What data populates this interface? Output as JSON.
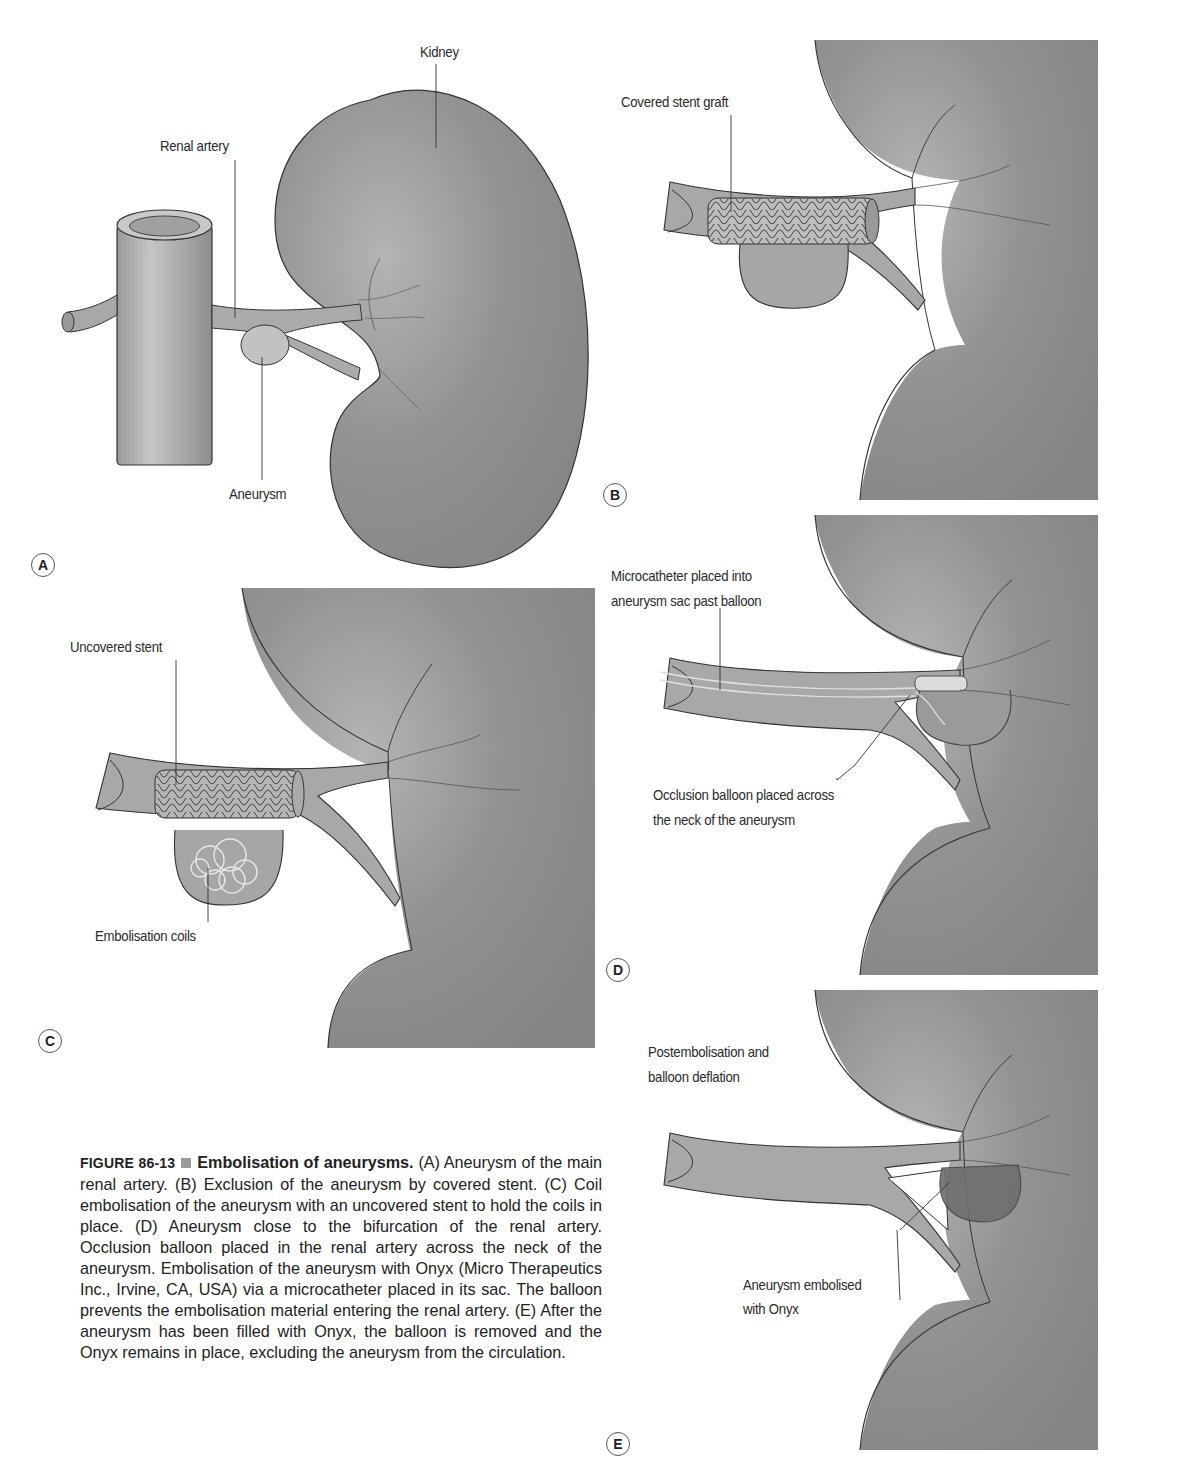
{
  "figure": {
    "number": "FIGURE 86-13",
    "title": "Embolisation of aneurysms.",
    "caption_body": "(A) Aneurysm of the main renal artery. (B) Exclusion of the aneurysm by covered stent. (C) Coil embolisation of the aneurysm with an uncovered stent to hold the coils in place. (D) Aneurysm close to the bifurcation of the renal artery. Occlusion balloon placed in the renal artery across the neck of the aneurysm. Embolisation of the aneurysm with Onyx (Micro Therapeutics Inc., Irvine, CA, USA) via a microcatheter placed in its sac. The balloon prevents the embolisation material entering the renal artery. (E) After the aneurysm has been filled with Onyx, the balloon is removed and the Onyx remains in place, excluding the aneurysm from the circulation."
  },
  "panels": {
    "A": {
      "badge": "A",
      "labels": {
        "kidney": "Kidney",
        "renal_artery": "Renal artery",
        "aneurysm": "Aneurysm"
      }
    },
    "B": {
      "badge": "B",
      "labels": {
        "stent": "Covered stent graft"
      }
    },
    "C": {
      "badge": "C",
      "labels": {
        "stent": "Uncovered stent",
        "coils": "Embolisation coils"
      }
    },
    "D": {
      "badge": "D",
      "labels": {
        "catheter_l1": "Microcatheter placed into",
        "catheter_l2": "aneurysm sac past balloon",
        "balloon_l1": "Occlusion balloon placed across",
        "balloon_l2": "the neck of the aneurysm"
      }
    },
    "E": {
      "badge": "E",
      "labels": {
        "post_l1": "Postembolisation and",
        "post_l2": "balloon deflation",
        "onyx_l1": "Aneurysm embolised",
        "onyx_l2": "with Onyx"
      }
    }
  },
  "colors": {
    "kidney_fill": "#8c8c8c",
    "vessel_fill": "#a6a6a6",
    "outline": "#333333",
    "onyx_fill": "#6e6e6e"
  }
}
